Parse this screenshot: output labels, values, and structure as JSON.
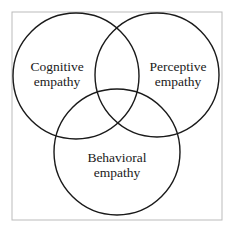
{
  "diagram": {
    "type": "venn",
    "frame": {
      "x": 12,
      "y": 12,
      "width": 210,
      "height": 208,
      "stroke": "#bbbbbb"
    },
    "circles": [
      {
        "id": "cognitive",
        "cx": 76,
        "cy": 76,
        "r": 63,
        "label_line1": "Cognitive",
        "label_line2": "empathy",
        "label_x": 57,
        "label_y1": 71,
        "label_y2": 86
      },
      {
        "id": "perceptive",
        "cx": 157,
        "cy": 75,
        "r": 62,
        "label_line1": "Perceptive",
        "label_line2": "empathy",
        "label_x": 178,
        "label_y1": 71,
        "label_y2": 86
      },
      {
        "id": "behavioral",
        "cx": 117,
        "cy": 152,
        "r": 63,
        "label_line1": "Behavioral",
        "label_line2": "empathy",
        "label_x": 117,
        "label_y1": 162,
        "label_y2": 177
      }
    ],
    "circle_stroke": "#1a1a1a"
  }
}
